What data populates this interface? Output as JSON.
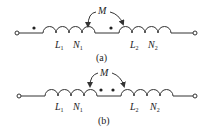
{
  "diagrams": [
    {
      "id": "a",
      "caption": "(a)",
      "mutual_label": "M",
      "coil1": {
        "inductance": "L",
        "inductance_sub": "1",
        "turns": "N",
        "turns_sub": "1"
      },
      "coil2": {
        "inductance": "L",
        "inductance_sub": "2",
        "turns": "N",
        "turns_sub": "2"
      },
      "dot_convention": "dots at left end of each coil (aiding)"
    },
    {
      "id": "b",
      "caption": "(b)",
      "mutual_label": "M",
      "coil1": {
        "inductance": "L",
        "inductance_sub": "1",
        "turns": "N",
        "turns_sub": "1"
      },
      "coil2": {
        "inductance": "L",
        "inductance_sub": "2",
        "turns": "N",
        "turns_sub": "2"
      },
      "dot_convention": "dots at right end of coil 1 and left end of coil 2 (opposing)"
    }
  ],
  "colors": {
    "stroke": "#333333",
    "background": "#ffffff"
  }
}
